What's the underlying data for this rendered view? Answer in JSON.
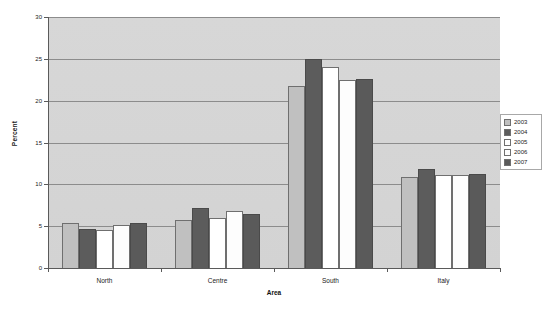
{
  "chart_data": {
    "type": "bar",
    "title": "",
    "xlabel": "Area",
    "ylabel": "Percent",
    "categories": [
      "North",
      "Centre",
      "South",
      "Italy"
    ],
    "series": [
      {
        "name": "2003",
        "color": "#c0c0c0",
        "values": [
          5.4,
          5.7,
          21.7,
          10.9
        ]
      },
      {
        "name": "2004",
        "color": "#5c5c5c",
        "values": [
          4.7,
          7.2,
          25.0,
          11.8
        ]
      },
      {
        "name": "2005",
        "color": "#ffffff",
        "values": [
          4.6,
          6.0,
          24.0,
          11.1
        ]
      },
      {
        "name": "2006",
        "color": "#fdfdfd",
        "values": [
          5.1,
          6.8,
          22.5,
          11.1
        ]
      },
      {
        "name": "2007",
        "color": "#5a5a5a",
        "values": [
          5.4,
          6.4,
          22.6,
          11.2
        ]
      }
    ],
    "ylim": [
      0,
      30
    ],
    "yticks": [
      0,
      5,
      10,
      15,
      20,
      25,
      30
    ],
    "ytick_labels": [
      "0",
      "5",
      "10",
      "15",
      "20",
      "25",
      "30"
    ],
    "grid": true,
    "legend_position": "right",
    "plot_background": "#d5d5d5"
  },
  "legend": {
    "entries": [
      "2003",
      "2004",
      "2005",
      "2006",
      "2007"
    ]
  },
  "axes": {
    "x_title": "Area",
    "y_title": "Percent"
  }
}
